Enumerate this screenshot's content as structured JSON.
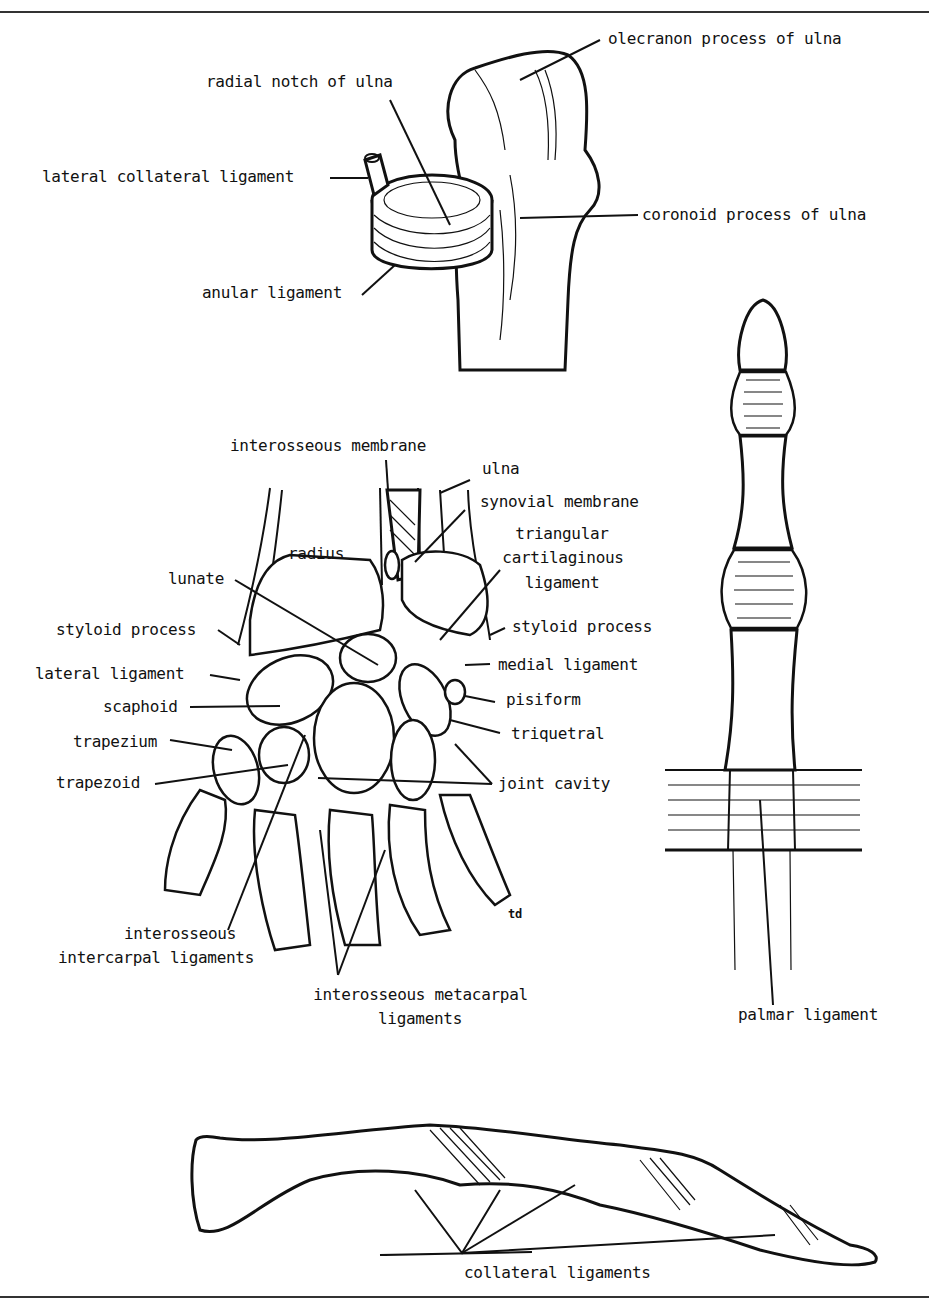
{
  "figure": {
    "elbow": {
      "labels": {
        "olecranon": "olecranon process of ulna",
        "radial_notch": "radial notch of ulna",
        "lateral_collateral": "lateral collateral ligament",
        "coronoid": "coronoid process of ulna",
        "anular": "anular ligament"
      }
    },
    "wrist": {
      "labels": {
        "interosseous_membrane": "interosseous membrane",
        "ulna": "ulna",
        "synovial_membrane": "synovial membrane",
        "triangular_1": "triangular",
        "triangular_2": "cartilaginous",
        "triangular_3": "ligament",
        "radius": "radius",
        "lunate": "lunate",
        "styloid_left": "styloid process",
        "styloid_right": "styloid process",
        "lateral_ligament": "lateral ligament",
        "medial_ligament": "medial ligament",
        "scaphoid": "scaphoid",
        "pisiform": "pisiform",
        "trapezium": "trapezium",
        "triquetral": "triquetral",
        "trapezoid": "trapezoid",
        "joint_cavity": "joint cavity",
        "intercarpal_1": "interosseous",
        "intercarpal_2": "intercarpal ligaments",
        "metacarpal_1": "interosseous metacarpal",
        "metacarpal_2": "ligaments",
        "artist_mark": "td"
      }
    },
    "finger_front": {
      "labels": {
        "palmar": "palmar ligament"
      }
    },
    "finger_side": {
      "labels": {
        "collateral": "collateral ligaments"
      }
    }
  }
}
